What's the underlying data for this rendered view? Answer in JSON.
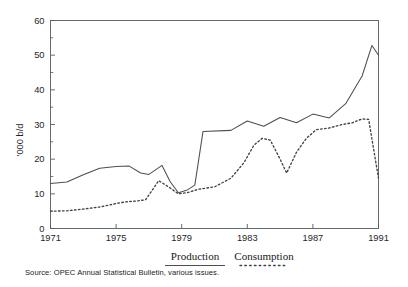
{
  "chart_data": {
    "type": "line",
    "title": "",
    "subtitle": "",
    "xlabel": "",
    "ylabel": "'000 b/d",
    "x": [
      1971,
      1972,
      1973,
      1974,
      1975,
      1976,
      1977,
      1978,
      1979,
      1980,
      1981,
      1982,
      1983,
      1984,
      1985,
      1986,
      1987,
      1988,
      1989,
      1990,
      1991
    ],
    "xlim": [
      1971,
      1991
    ],
    "ylim": [
      0,
      60
    ],
    "xticks": [
      1971,
      1975,
      1979,
      1983,
      1987,
      1991
    ],
    "xticklabels": [
      "1971",
      "1975",
      "1979",
      "1983",
      "1987",
      "1991"
    ],
    "yticks": [
      0,
      10,
      20,
      30,
      40,
      50,
      60
    ],
    "yticklabels": [
      "0",
      "10",
      "20",
      "30",
      "40",
      "50",
      "60"
    ],
    "yminorticks": [
      5,
      15,
      25,
      35,
      45,
      55
    ],
    "grid": false,
    "legend_position": "below-axes",
    "series": [
      {
        "name": "Production",
        "style": "solid",
        "color": "#4a4f54",
        "values": [
          13.0,
          13.4,
          15.5,
          17.4,
          17.9,
          18.0,
          16.0,
          15.6,
          18.2,
          13.5,
          10.3,
          11.0,
          12.5,
          28.0,
          28.3,
          31.0,
          29.5,
          32.0,
          30.5,
          33.0,
          31.9
        ]
      },
      {
        "name": "Consumption",
        "style": "dotted",
        "color": "#3e4348",
        "values": [
          5.0,
          5.1,
          5.5,
          6.0,
          7.0,
          7.6,
          8.0,
          8.2,
          8.6,
          13.8,
          11.5,
          10.0,
          10.8,
          11.6,
          12.3,
          13.0,
          15.0,
          19.5,
          23.0,
          26.0,
          25.5
        ]
      }
    ],
    "series_full": [
      {
        "name": "Production",
        "style": "solid",
        "points": [
          {
            "x": 1971,
            "y": 13.0
          },
          {
            "x": 1972,
            "y": 13.4
          },
          {
            "x": 1973,
            "y": 15.5
          },
          {
            "x": 1974,
            "y": 17.4
          },
          {
            "x": 1975,
            "y": 17.9
          },
          {
            "x": 1975.8,
            "y": 18.0
          },
          {
            "x": 1976.5,
            "y": 16.0
          },
          {
            "x": 1977,
            "y": 15.6
          },
          {
            "x": 1977.8,
            "y": 18.2
          },
          {
            "x": 1978.3,
            "y": 13.5
          },
          {
            "x": 1978.8,
            "y": 10.3
          },
          {
            "x": 1979.3,
            "y": 11.0
          },
          {
            "x": 1979.8,
            "y": 12.5
          },
          {
            "x": 1980.3,
            "y": 28.0
          },
          {
            "x": 1982.0,
            "y": 28.3
          },
          {
            "x": 1983.0,
            "y": 31.0
          },
          {
            "x": 1984.0,
            "y": 29.5
          },
          {
            "x": 1985.0,
            "y": 32.0
          },
          {
            "x": 1986.0,
            "y": 30.5
          },
          {
            "x": 1987.0,
            "y": 33.0
          },
          {
            "x": 1988.0,
            "y": 31.9
          },
          {
            "x": 1989.0,
            "y": 36.0
          },
          {
            "x": 1990.0,
            "y": 44.0
          },
          {
            "x": 1990.6,
            "y": 52.8
          },
          {
            "x": 1991.0,
            "y": 50.0
          }
        ]
      },
      {
        "name": "Consumption",
        "style": "dotted",
        "points": [
          {
            "x": 1971,
            "y": 5.0
          },
          {
            "x": 1972,
            "y": 5.1
          },
          {
            "x": 1973,
            "y": 5.6
          },
          {
            "x": 1974,
            "y": 6.2
          },
          {
            "x": 1975,
            "y": 7.2
          },
          {
            "x": 1975.6,
            "y": 7.7
          },
          {
            "x": 1976.2,
            "y": 7.9
          },
          {
            "x": 1976.8,
            "y": 8.3
          },
          {
            "x": 1977.6,
            "y": 13.8
          },
          {
            "x": 1978.2,
            "y": 12.0
          },
          {
            "x": 1978.8,
            "y": 10.0
          },
          {
            "x": 1979.4,
            "y": 10.4
          },
          {
            "x": 1980.0,
            "y": 11.3
          },
          {
            "x": 1981.0,
            "y": 12.0
          },
          {
            "x": 1982.0,
            "y": 14.5
          },
          {
            "x": 1982.8,
            "y": 19.0
          },
          {
            "x": 1983.4,
            "y": 24.0
          },
          {
            "x": 1983.9,
            "y": 26.0
          },
          {
            "x": 1984.4,
            "y": 25.5
          },
          {
            "x": 1985.0,
            "y": 20.0
          },
          {
            "x": 1985.4,
            "y": 16.0
          },
          {
            "x": 1986.0,
            "y": 22.0
          },
          {
            "x": 1986.6,
            "y": 26.0
          },
          {
            "x": 1987.2,
            "y": 28.5
          },
          {
            "x": 1988.0,
            "y": 29.0
          },
          {
            "x": 1988.8,
            "y": 30.0
          },
          {
            "x": 1989.4,
            "y": 30.5
          },
          {
            "x": 1990.0,
            "y": 31.6
          },
          {
            "x": 1990.4,
            "y": 31.5
          },
          {
            "x": 1991.0,
            "y": 14.5
          }
        ]
      }
    ]
  },
  "legend": {
    "entries": [
      {
        "label": "Production",
        "style": "solid"
      },
      {
        "label": "Consumption",
        "style": "dotted"
      }
    ]
  },
  "source": {
    "text": "Source: OPEC Annual Statistical Bulletin, various issues."
  }
}
